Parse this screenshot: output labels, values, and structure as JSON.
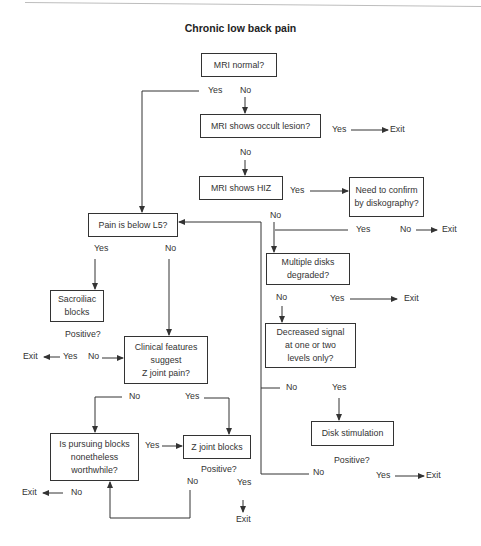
{
  "title": "Chronic low back pain",
  "boxes": {
    "mri_normal": "MRI normal?",
    "occult_lesion": "MRI shows occult lesion?",
    "hiz": "MRI shows HIZ",
    "confirm_diskography": "Need to confirm\nby diskography?",
    "pain_below_l5": "Pain is below L5?",
    "multiple_disks": "Multiple disks\ndegraded?",
    "sacroiliac": "Sacroiliac\nblocks",
    "clinical_features": "Clinical features\nsuggest\nZ joint pain?",
    "decreased_signal": "Decreased signal\nat one or two\nlevels only?",
    "pursuing_blocks": "Is pursuing blocks\nnonetheless\nworthwhile?",
    "z_joint_blocks": "Z joint blocks",
    "disk_stimulation": "Disk stimulation"
  },
  "labels": {
    "mri_normal_yes": "Yes",
    "mri_normal_no": "No",
    "occult_yes": "Yes",
    "occult_exit": "Exit",
    "occult_no": "No",
    "hiz_yes": "Yes",
    "hiz_no": "No",
    "confirm_yes": "Yes",
    "confirm_no": "No",
    "confirm_exit": "Exit",
    "pain_yes": "Yes",
    "pain_no": "No",
    "multi_no": "No",
    "multi_yes": "Yes",
    "multi_exit": "Exit",
    "sacro_positive": "Positive?",
    "sacro_exit": "Exit",
    "sacro_yes": "Yes",
    "sacro_no": "No",
    "decreased_no": "No",
    "decreased_yes": "Yes",
    "clinical_no": "No",
    "clinical_yes": "Yes",
    "pursuing_yes": "Yes",
    "pursuing_exit": "Exit",
    "pursuing_no": "No",
    "zjoint_positive": "Positive?",
    "zjoint_no": "No",
    "zjoint_yes": "Yes",
    "zjoint_exit": "Exit",
    "disk_positive": "Positive?",
    "disk_no": "No",
    "disk_yes": "Yes",
    "disk_exit": "Exit"
  }
}
